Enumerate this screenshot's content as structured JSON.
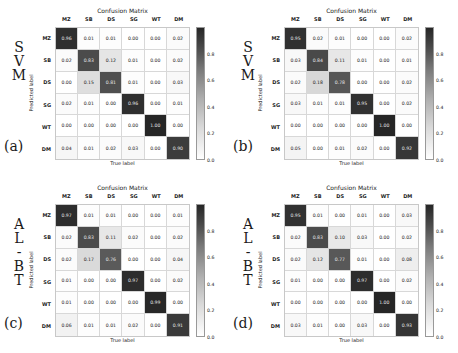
{
  "figure": {
    "panels": [
      {
        "id": "a",
        "panel_label": "(a)",
        "model_name": "SVM",
        "model_letters": [
          "S",
          "V",
          "M"
        ],
        "title": "Confusion Matrix",
        "xlabel": "True label",
        "ylabel": "Predicted label",
        "classes": [
          "MZ",
          "SB",
          "DS",
          "SG",
          "WT",
          "DM"
        ],
        "values": [
          [
            "0.96",
            "0.01",
            "0.01",
            "0.00",
            "0.00",
            "0.02"
          ],
          [
            "0.02",
            "0.83",
            "0.12",
            "0.01",
            "0.00",
            "0.02"
          ],
          [
            "0.00",
            "0.15",
            "0.81",
            "0.01",
            "0.00",
            "0.03"
          ],
          [
            "0.02",
            "0.01",
            "0.00",
            "0.96",
            "0.00",
            "0.01"
          ],
          [
            "0.00",
            "0.00",
            "0.00",
            "0.00",
            "1.00",
            "0.00"
          ],
          [
            "0.04",
            "0.01",
            "0.02",
            "0.03",
            "0.00",
            "0.90"
          ]
        ]
      },
      {
        "id": "b",
        "panel_label": "(b)",
        "model_name": "SVM",
        "model_letters": [
          "S",
          "V",
          "M"
        ],
        "title": "Confusion Matrix",
        "xlabel": "True label",
        "ylabel": "Predicted label",
        "classes": [
          "MZ",
          "SB",
          "DS",
          "SG",
          "WT",
          "DM"
        ],
        "values": [
          [
            "0.95",
            "0.02",
            "0.01",
            "0.00",
            "0.00",
            "0.02"
          ],
          [
            "0.03",
            "0.84",
            "0.11",
            "0.01",
            "0.00",
            "0.01"
          ],
          [
            "0.02",
            "0.18",
            "0.78",
            "0.00",
            "0.00",
            "0.02"
          ],
          [
            "0.03",
            "0.01",
            "0.01",
            "0.95",
            "0.00",
            "0.02"
          ],
          [
            "0.00",
            "0.00",
            "0.00",
            "0.00",
            "1.00",
            "0.00"
          ],
          [
            "0.05",
            "0.00",
            "0.01",
            "0.02",
            "0.00",
            "0.92"
          ]
        ]
      },
      {
        "id": "c",
        "panel_label": "(c)",
        "model_name": "ALBT",
        "model_letters": [
          "A",
          "L",
          "-",
          "B",
          "T"
        ],
        "title": "Confusion Matrix",
        "xlabel": "True label",
        "ylabel": "Predicted label",
        "classes": [
          "MZ",
          "SB",
          "DS",
          "SG",
          "WT",
          "DM"
        ],
        "values": [
          [
            "0.97",
            "0.01",
            "0.01",
            "0.00",
            "0.00",
            "0.01"
          ],
          [
            "0.02",
            "0.83",
            "0.11",
            "0.02",
            "0.00",
            "0.02"
          ],
          [
            "0.02",
            "0.17",
            "0.76",
            "0.00",
            "0.00",
            "0.04"
          ],
          [
            "0.01",
            "0.00",
            "0.00",
            "0.97",
            "0.00",
            "0.02"
          ],
          [
            "0.01",
            "0.00",
            "0.00",
            "0.00",
            "0.99",
            "0.00"
          ],
          [
            "0.06",
            "0.01",
            "0.01",
            "0.02",
            "0.00",
            "0.91"
          ]
        ]
      },
      {
        "id": "d",
        "panel_label": "(d)",
        "model_name": "ALBT",
        "model_letters": [
          "A",
          "L",
          "-",
          "B",
          "T"
        ],
        "title": "Confusion Matrix",
        "xlabel": "True label",
        "ylabel": "Predicted label",
        "classes": [
          "MZ",
          "SB",
          "DS",
          "SG",
          "WT",
          "DM"
        ],
        "values": [
          [
            "0.95",
            "0.01",
            "0.00",
            "0.01",
            "0.00",
            "0.03"
          ],
          [
            "0.02",
            "0.83",
            "0.10",
            "0.03",
            "0.00",
            "0.02"
          ],
          [
            "0.02",
            "0.12",
            "0.77",
            "0.01",
            "0.00",
            "0.08"
          ],
          [
            "0.01",
            "0.00",
            "0.00",
            "0.97",
            "0.00",
            "0.02"
          ],
          [
            "0.00",
            "0.00",
            "0.00",
            "0.00",
            "1.00",
            "0.00"
          ],
          [
            "0.03",
            "0.01",
            "0.00",
            "0.03",
            "0.00",
            "0.93"
          ]
        ]
      }
    ],
    "colorbar": {
      "ticks": [
        "0.0",
        "0.2",
        "0.4",
        "0.6",
        "0.8"
      ],
      "vmin": 0.0,
      "vmax": 1.0,
      "colormap": "grayscale-inverted",
      "low_color": "#ffffff",
      "high_color": "#262626"
    }
  },
  "chart_data": {
    "type": "heatmap",
    "title": "Confusion Matrix",
    "xlabel": "True label",
    "ylabel": "Predicted label",
    "categories": [
      "MZ",
      "SB",
      "DS",
      "SG",
      "WT",
      "DM"
    ],
    "zlim": [
      0.0,
      1.0
    ],
    "colorbar_ticks": [
      0.0,
      0.2,
      0.4,
      0.6,
      0.8
    ],
    "grid": true,
    "legend_position": "right-colorbar",
    "panels": [
      {
        "label": "(a)",
        "model": "SVM",
        "matrix": [
          [
            0.96,
            0.01,
            0.01,
            0.0,
            0.0,
            0.02
          ],
          [
            0.02,
            0.83,
            0.12,
            0.01,
            0.0,
            0.02
          ],
          [
            0.0,
            0.15,
            0.81,
            0.01,
            0.0,
            0.03
          ],
          [
            0.02,
            0.01,
            0.0,
            0.96,
            0.0,
            0.01
          ],
          [
            0.0,
            0.0,
            0.0,
            0.0,
            1.0,
            0.0
          ],
          [
            0.04,
            0.01,
            0.02,
            0.03,
            0.0,
            0.9
          ]
        ]
      },
      {
        "label": "(b)",
        "model": "SVM",
        "matrix": [
          [
            0.95,
            0.02,
            0.01,
            0.0,
            0.0,
            0.02
          ],
          [
            0.03,
            0.84,
            0.11,
            0.01,
            0.0,
            0.01
          ],
          [
            0.02,
            0.18,
            0.78,
            0.0,
            0.0,
            0.02
          ],
          [
            0.03,
            0.01,
            0.01,
            0.95,
            0.0,
            0.02
          ],
          [
            0.0,
            0.0,
            0.0,
            0.0,
            1.0,
            0.0
          ],
          [
            0.05,
            0.0,
            0.01,
            0.02,
            0.0,
            0.92
          ]
        ]
      },
      {
        "label": "(c)",
        "model": "ALBT",
        "matrix": [
          [
            0.97,
            0.01,
            0.01,
            0.0,
            0.0,
            0.01
          ],
          [
            0.02,
            0.83,
            0.11,
            0.02,
            0.0,
            0.02
          ],
          [
            0.02,
            0.17,
            0.76,
            0.0,
            0.0,
            0.04
          ],
          [
            0.01,
            0.0,
            0.0,
            0.97,
            0.0,
            0.02
          ],
          [
            0.01,
            0.0,
            0.0,
            0.0,
            0.99,
            0.0
          ],
          [
            0.06,
            0.01,
            0.01,
            0.02,
            0.0,
            0.91
          ]
        ]
      },
      {
        "label": "(d)",
        "model": "ALBT",
        "matrix": [
          [
            0.95,
            0.01,
            0.0,
            0.01,
            0.0,
            0.03
          ],
          [
            0.02,
            0.83,
            0.1,
            0.03,
            0.0,
            0.02
          ],
          [
            0.02,
            0.12,
            0.77,
            0.01,
            0.0,
            0.08
          ],
          [
            0.01,
            0.0,
            0.0,
            0.97,
            0.0,
            0.02
          ],
          [
            0.0,
            0.0,
            0.0,
            0.0,
            1.0,
            0.0
          ],
          [
            0.03,
            0.01,
            0.0,
            0.03,
            0.0,
            0.93
          ]
        ]
      }
    ]
  }
}
